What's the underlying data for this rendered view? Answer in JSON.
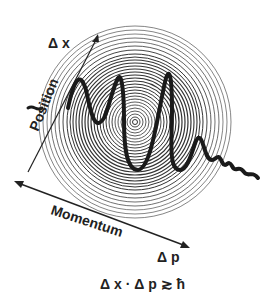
{
  "diagram": {
    "labels": {
      "delta_x": "Δ x",
      "position": "Position",
      "momentum": "Momentum",
      "delta_p": "Δ p",
      "equation": "Δ x · Δ p ≳ ħ"
    },
    "colors": {
      "ink": "#222222",
      "wave": "#1a1a1a",
      "background": "#ffffff"
    }
  }
}
